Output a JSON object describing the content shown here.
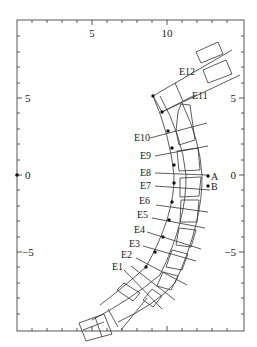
{
  "figure": {
    "type": "beamline-layout-diagram",
    "axes": {
      "top_ticks": [
        {
          "label": "5",
          "x": 92
        },
        {
          "label": "10",
          "x": 167
        }
      ],
      "left_ticks": [
        {
          "label": "5",
          "y": 98
        },
        {
          "label": "0",
          "y": 175
        },
        {
          "label": "−5",
          "y": 252
        }
      ],
      "right_ticks": [
        {
          "label": "5",
          "y": 98
        },
        {
          "label": "0",
          "y": 175
        },
        {
          "label": "−5",
          "y": 252
        }
      ]
    },
    "elements": [
      {
        "label": "E1"
      },
      {
        "label": "E2"
      },
      {
        "label": "E3"
      },
      {
        "label": "E4"
      },
      {
        "label": "E5"
      },
      {
        "label": "E6"
      },
      {
        "label": "E7"
      },
      {
        "label": "E8"
      },
      {
        "label": "E9"
      },
      {
        "label": "E10"
      },
      {
        "label": "E11"
      },
      {
        "label": "E12"
      }
    ],
    "points": [
      {
        "label": "A"
      },
      {
        "label": "B"
      }
    ]
  }
}
